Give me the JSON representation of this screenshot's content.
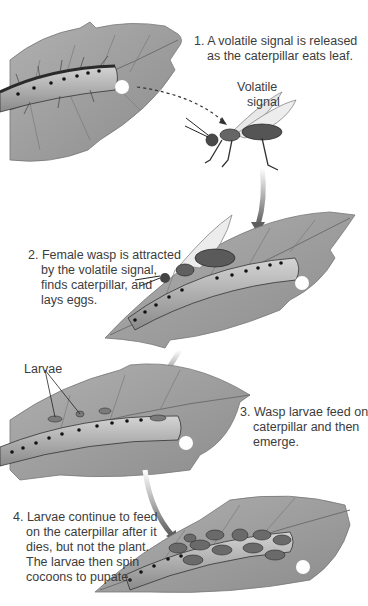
{
  "diagram": {
    "type": "process-sequence",
    "steps": [
      {
        "number": "1.",
        "lines": [
          "A volatile signal is released",
          "as the caterpillar eats leaf."
        ]
      },
      {
        "number": "2.",
        "lines": [
          "Female wasp is attracted",
          "by the volatile signal,",
          "finds caterpillar, and",
          "lays eggs."
        ]
      },
      {
        "number": "3.",
        "lines": [
          "Wasp larvae feed on",
          "caterpillar and then",
          "emerge."
        ]
      },
      {
        "number": "4.",
        "lines": [
          "Larvae continue to feed",
          "on the caterpillar after it",
          "dies, but not the plant.",
          "The larvae then spin",
          "cocoons to pupate."
        ]
      }
    ],
    "labels": {
      "volatile_signal_line1": "Volatile",
      "volatile_signal_line2": "signal",
      "larvae": "Larvae"
    },
    "colors": {
      "leaf": "#9a9a9a",
      "leaf_vein": "#6e6e6e",
      "caterpillar_body": "#bdbdbd",
      "caterpillar_dark": "#3d3d3d",
      "arrow": "#707070",
      "text": "#3c3c3c",
      "background": "#ffffff"
    }
  }
}
